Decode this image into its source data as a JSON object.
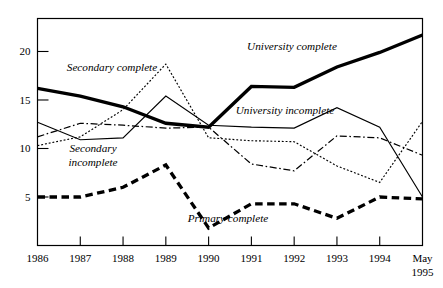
{
  "chart_data": {
    "type": "line",
    "title": "",
    "subtitle": "",
    "xlabel": "",
    "ylabel": "",
    "categories": [
      "1986",
      "1987",
      "1988",
      "1989",
      "1990",
      "1991",
      "1992",
      "1993",
      "1994",
      "May 1995"
    ],
    "x_tick_labels": [
      "1986",
      "1987",
      "1988",
      "1989",
      "1990",
      "1991",
      "1992",
      "1993",
      "1994",
      "May"
    ],
    "x_tick_labels_second_line": [
      "",
      "",
      "",
      "",
      "",
      "",
      "",
      "",
      "",
      "1995"
    ],
    "y_tick_labels": [
      "5",
      "10",
      "15",
      "20"
    ],
    "y_tick_values": [
      5,
      10,
      15,
      20
    ],
    "ylim": [
      0,
      23.4
    ],
    "grid": false,
    "legend_position": "inline-annotations",
    "series": [
      {
        "name": "University complete",
        "style": "thick-solid",
        "annotation": "University complete",
        "values": [
          16.2,
          15.4,
          14.3,
          12.6,
          12.2,
          16.4,
          16.3,
          18.4,
          19.9,
          21.7
        ]
      },
      {
        "name": "Secondary complete",
        "style": "fine-dotted",
        "annotation": "Secondary complete",
        "values": [
          10.3,
          11.2,
          14.0,
          18.7,
          11.1,
          10.8,
          10.7,
          8.2,
          6.5,
          12.8
        ]
      },
      {
        "name": "Secondary incomplete",
        "style": "dash-dot",
        "annotation": "Secondary incomplete",
        "values": [
          11.2,
          12.6,
          12.4,
          12.1,
          12.2,
          8.4,
          7.7,
          11.3,
          11.1,
          9.3
        ]
      },
      {
        "name": "University incomplete",
        "style": "thin-solid",
        "annotation": "University incomplete",
        "values": [
          12.7,
          10.9,
          11.1,
          15.4,
          12.4,
          12.2,
          12.1,
          14.2,
          12.2,
          5.0
        ]
      },
      {
        "name": "Primary complete",
        "style": "thick-dashed",
        "annotation": "Primary complete",
        "values": [
          5.0,
          5.0,
          6.0,
          8.3,
          1.8,
          4.3,
          4.3,
          2.8,
          5.0,
          4.8
        ]
      }
    ],
    "annotations": [
      {
        "text": "Secondary complete",
        "x": 112,
        "y": 71
      },
      {
        "text": "University complete",
        "x": 292,
        "y": 50
      },
      {
        "text": "University incomplete",
        "x": 285,
        "y": 114
      },
      {
        "text": "Secondary",
        "x": 93,
        "y": 152
      },
      {
        "text": "incomplete",
        "x": 93,
        "y": 166
      },
      {
        "text": "Primary complete",
        "x": 228,
        "y": 222
      }
    ],
    "colors": {
      "line": "#000000",
      "axis": "#000000",
      "background": "#ffffff"
    }
  }
}
